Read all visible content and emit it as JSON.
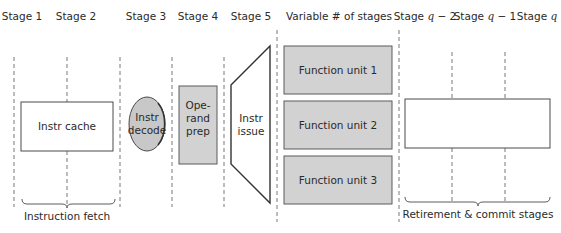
{
  "diagram": {
    "stage_headers": [
      {
        "text": "Stage 1"
      },
      {
        "text": "Stage 2"
      },
      {
        "text": "Stage 3"
      },
      {
        "text": "Stage 4"
      },
      {
        "text": "Stage 5"
      },
      {
        "text": "Variable # of stages"
      },
      {
        "prefix": "Stage ",
        "var": "q",
        "suffix": " − 2"
      },
      {
        "prefix": "Stage ",
        "var": "q",
        "suffix": " − 1"
      },
      {
        "prefix": "Stage ",
        "var": "q",
        "suffix": ""
      }
    ],
    "blocks": {
      "instr_cache": "Instr cache",
      "instr_decode": [
        "Instr",
        "decode"
      ],
      "operand_prep": [
        "Ope-",
        "rand",
        "prep"
      ],
      "instr_issue": [
        "Instr",
        "issue"
      ],
      "function_units": [
        "Function unit 1",
        "Function unit 2",
        "Function unit 3"
      ]
    },
    "groups": {
      "instruction_fetch": "Instruction fetch",
      "retirement": "Retirement & commit stages"
    },
    "colors": {
      "shaded_fill": "#d2d2d2",
      "decode_fill": "#c8c8c8",
      "outline": "#4a4a4a"
    }
  }
}
